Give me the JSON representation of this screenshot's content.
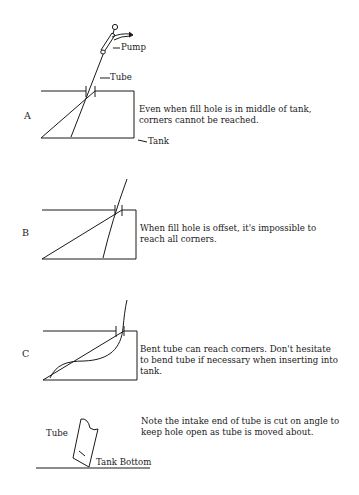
{
  "panels": [
    {
      "letter": "A",
      "caption": "Even when fill hole is in middle of tank, corners cannot be reached.",
      "labels": {
        "pump": "Pump",
        "tube": "Tube",
        "tank": "Tank"
      }
    },
    {
      "letter": "B",
      "caption": "When fill hole is offset, it's impossible to reach all corners."
    },
    {
      "letter": "C",
      "caption": "Bent tube can reach corners. Don't hesitate to bend tube if necessary when inserting into tank."
    },
    {
      "letter": "",
      "caption": "Note the intake end of tube is cut on angle to keep hole open as tube is moved about.",
      "labels": {
        "tube": "Tube",
        "tank_bottom": "Tank Bottom"
      }
    }
  ],
  "colors": {
    "ink": "#1a1a1a",
    "background": "#ffffff"
  }
}
